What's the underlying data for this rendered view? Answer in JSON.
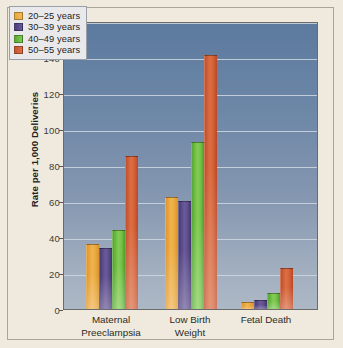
{
  "chart_data": {
    "type": "bar",
    "title": "",
    "xlabel": "",
    "ylabel": "Rate per 1,000 Deliveries",
    "ylim": [
      0,
      160
    ],
    "ytick_step": 20,
    "yticks": [
      0,
      20,
      40,
      60,
      80,
      100,
      120,
      140,
      160
    ],
    "ytick_labels": [
      "0",
      "20",
      "40",
      "60",
      "80",
      "100",
      "120",
      "140",
      "160"
    ],
    "grid": true,
    "legend_position": "top-left",
    "categories": [
      "Maternal Preeclampsia",
      "Low Birth Weight",
      "Fetal Death"
    ],
    "category_lines": [
      [
        "Maternal",
        "Preeclampsia"
      ],
      [
        "Low Birth",
        "Weight"
      ],
      [
        "Fetal Death",
        ""
      ]
    ],
    "series": [
      {
        "name": "20–25 years",
        "color": "#e9a93f",
        "values": [
          36,
          62,
          4
        ]
      },
      {
        "name": "30–39 years",
        "color": "#5d4e8c",
        "values": [
          34,
          60,
          5
        ]
      },
      {
        "name": "40–49 years",
        "color": "#73c146",
        "values": [
          44,
          93,
          9
        ]
      },
      {
        "name": "50–55 years",
        "color": "#d25f36",
        "values": [
          85,
          141,
          23
        ]
      }
    ]
  },
  "legend": {
    "items": [
      {
        "label": "20–25 years"
      },
      {
        "label": "30–39 years"
      },
      {
        "label": "40–49 years"
      },
      {
        "label": "50–55 years"
      }
    ]
  },
  "axes": {
    "y_label": "Rate per 1,000 Deliveries",
    "y_ticks": [
      "160",
      "140",
      "120",
      "100",
      "80",
      "60",
      "40",
      "20",
      "0"
    ],
    "x_groups": [
      {
        "line1": "Maternal",
        "line2": "Preeclampsia"
      },
      {
        "line1": "Low Birth",
        "line2": "Weight"
      },
      {
        "line1": "Fetal Death",
        "line2": ""
      }
    ]
  },
  "colors": {
    "background": "#efeadd",
    "plot_top": "#5c7a9f",
    "plot_bottom": "#adb8c6",
    "gridline": "#cfd8e2",
    "series_20_25": "#e9a93f",
    "series_30_39": "#5d4e8c",
    "series_40_49": "#73c146",
    "series_50_55": "#d25f36"
  }
}
